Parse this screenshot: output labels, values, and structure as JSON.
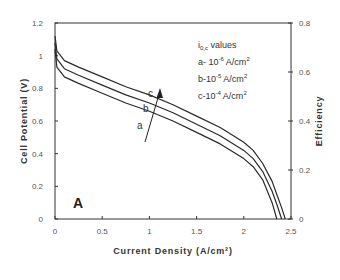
{
  "chart_data": {
    "type": "line",
    "title": "",
    "panel_label": "A",
    "xlabel": "Current Density (A/cm²)",
    "ylabel": "Cell Potential (V)",
    "y2label": "Efficiency",
    "xlim": [
      0,
      2.5
    ],
    "ylim": [
      0,
      1.2
    ],
    "y2lim": [
      0,
      0.8
    ],
    "xticks": [
      "0",
      "0.5",
      "1",
      "1.5",
      "2",
      "2.5"
    ],
    "yticks": [
      "0",
      "0.2",
      "0.4",
      "0.6",
      "0.8",
      "1",
      "1.2"
    ],
    "y2ticks": [
      "0",
      "0.2",
      "0.4",
      "0.6",
      "0.8"
    ],
    "grid": false,
    "legend": {
      "title": "i",
      "title_sub": "0,c",
      "title_rest": " values",
      "entries": [
        {
          "prefix": "a- 10",
          "exp": "-6",
          "unit": " A/cm",
          "unit_exp": "2"
        },
        {
          "prefix": "b-10",
          "exp": "-5",
          "unit": " A/cm",
          "unit_exp": "2"
        },
        {
          "prefix": "c-10",
          "exp": "-4",
          "unit": " A/cm",
          "unit_exp": "2"
        }
      ],
      "position": "upper right"
    },
    "annotations": {
      "arrow": "increasing i0,c from a to c",
      "curve_labels": [
        "a",
        "b",
        "c"
      ]
    },
    "x": [
      0,
      0.02,
      0.1,
      0.25,
      0.5,
      0.75,
      1.0,
      1.25,
      1.5,
      1.75,
      2.0,
      2.1,
      2.2,
      2.3,
      2.35,
      2.4,
      2.44
    ],
    "series": [
      {
        "name": "a (i0,c = 1e-6 A/cm²)",
        "values": [
          1.04,
          0.93,
          0.87,
          0.83,
          0.77,
          0.71,
          0.66,
          0.6,
          0.53,
          0.46,
          0.37,
          0.32,
          0.24,
          0.1,
          0.0,
          null,
          null
        ]
      },
      {
        "name": "b (i0,c = 1e-5 A/cm²)",
        "values": [
          1.08,
          0.98,
          0.92,
          0.88,
          0.82,
          0.76,
          0.71,
          0.65,
          0.58,
          0.51,
          0.42,
          0.37,
          0.29,
          0.17,
          0.09,
          0.0,
          null
        ]
      },
      {
        "name": "c (i0,c = 1e-4 A/cm²)",
        "values": [
          1.12,
          1.03,
          0.97,
          0.93,
          0.87,
          0.81,
          0.76,
          0.7,
          0.63,
          0.56,
          0.47,
          0.42,
          0.34,
          0.23,
          0.15,
          0.07,
          0.0
        ]
      }
    ]
  }
}
